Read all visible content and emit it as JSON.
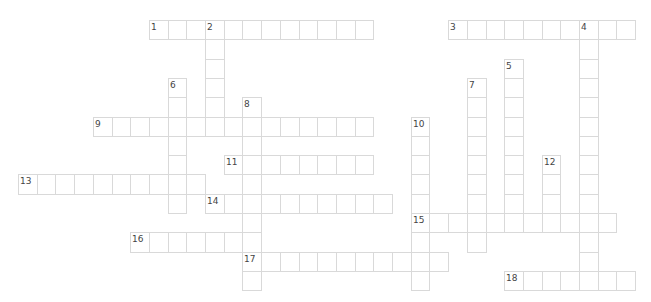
{
  "puzzle": {
    "grid": {
      "origin_x": 18,
      "origin_y": 20,
      "cell_w": 18.7,
      "cell_h": 19.3
    },
    "colors": {
      "border": "#d9d9d9",
      "cell_bg": "#ffffff",
      "number": "#444444"
    },
    "entries": [
      {
        "number": "1",
        "direction": "across",
        "row": 0,
        "col": 7,
        "length": 12
      },
      {
        "number": "2",
        "direction": "down",
        "row": 0,
        "col": 10,
        "length": 6
      },
      {
        "number": "3",
        "direction": "across",
        "row": 0,
        "col": 23,
        "length": 10
      },
      {
        "number": "4",
        "direction": "down",
        "row": 0,
        "col": 30,
        "length": 14
      },
      {
        "number": "5",
        "direction": "down",
        "row": 2,
        "col": 26,
        "length": 9
      },
      {
        "number": "6",
        "direction": "down",
        "row": 3,
        "col": 8,
        "length": 7
      },
      {
        "number": "7",
        "direction": "down",
        "row": 3,
        "col": 24,
        "length": 9
      },
      {
        "number": "8",
        "direction": "down",
        "row": 4,
        "col": 12,
        "length": 10
      },
      {
        "number": "9",
        "direction": "across",
        "row": 5,
        "col": 4,
        "length": 15
      },
      {
        "number": "10",
        "direction": "down",
        "row": 5,
        "col": 21,
        "length": 9
      },
      {
        "number": "11",
        "direction": "across",
        "row": 7,
        "col": 11,
        "length": 8
      },
      {
        "number": "12",
        "direction": "down",
        "row": 7,
        "col": 28,
        "length": 4
      },
      {
        "number": "13",
        "direction": "across",
        "row": 8,
        "col": 0,
        "length": 10
      },
      {
        "number": "14",
        "direction": "across",
        "row": 9,
        "col": 10,
        "length": 10
      },
      {
        "number": "15",
        "direction": "across",
        "row": 10,
        "col": 21,
        "length": 11
      },
      {
        "number": "16",
        "direction": "across",
        "row": 11,
        "col": 6,
        "length": 7
      },
      {
        "number": "17",
        "direction": "across",
        "row": 12,
        "col": 12,
        "length": 11
      },
      {
        "number": "18",
        "direction": "across",
        "row": 13,
        "col": 26,
        "length": 7
      }
    ]
  }
}
